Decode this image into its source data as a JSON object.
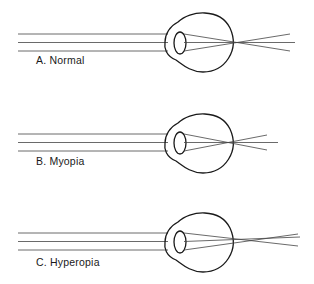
{
  "panels": [
    {
      "id": "normal",
      "label": "A. Normal",
      "focus": "on-retina"
    },
    {
      "id": "myopia",
      "label": "B. Myopia",
      "focus": "in-front-of-retina"
    },
    {
      "id": "hyperopia",
      "label": "C. Hyperopia",
      "focus": "behind-retina"
    }
  ],
  "colors": {
    "stroke": "#1a1a1a",
    "ray": "#444444",
    "background": "#ffffff"
  }
}
